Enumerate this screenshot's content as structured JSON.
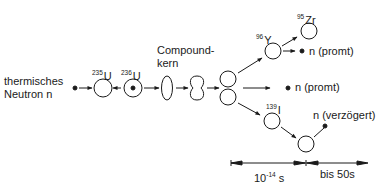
{
  "incoming": {
    "line1": "thermisches",
    "line2": "Neutron n"
  },
  "nuclei": {
    "u235": {
      "mass": "235",
      "symbol": "U"
    },
    "u236": {
      "mass": "236",
      "symbol": "U"
    },
    "compound": {
      "line1": "Compound-",
      "line2": "kern"
    },
    "y96": {
      "mass": "96",
      "symbol": "Y"
    },
    "zr95": {
      "mass": "95",
      "symbol": "Zr"
    },
    "i139": {
      "mass": "139",
      "symbol": "I"
    }
  },
  "neutrons": {
    "prompt1": "n (promt)",
    "prompt2": "n (promt)",
    "delayed": "n (verzögert)"
  },
  "timeline": {
    "left": {
      "base": "10",
      "exp": "-14",
      "unit": " s"
    },
    "right": "bis 50s"
  },
  "colors": {
    "stroke": "#1a1a1a",
    "background": "#ffffff"
  }
}
